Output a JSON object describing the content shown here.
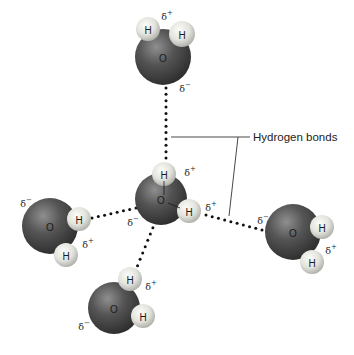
{
  "diagram": {
    "callout_label": "Hydrogen bonds",
    "colors": {
      "oxygen_dark": "#3f3f3f",
      "oxygen_light": "#8a8a8a",
      "hydrogen_light": "#f2f2ee",
      "hydrogen_dark": "#b8b8b2",
      "bond_dots": "#111111",
      "line": "#333333"
    },
    "atom_labels": {
      "oxygen": "O",
      "hydrogen": "H"
    },
    "charges": {
      "positive": "δ+",
      "negative": "δ−"
    },
    "molecules": [
      {
        "id": "top",
        "oxygen": {
          "label": "O",
          "x": 163,
          "y": 57,
          "r": 28
        },
        "hydrogens": [
          {
            "label": "H",
            "x": 148,
            "y": 29,
            "r": 12
          },
          {
            "label": "H",
            "x": 182,
            "y": 34,
            "r": 13
          }
        ],
        "charges": [
          {
            "label": "δ+",
            "x": 167,
            "y": 16
          },
          {
            "label": "δ−",
            "x": 185,
            "y": 88
          }
        ]
      },
      {
        "id": "center",
        "oxygen": {
          "label": "O",
          "x": 161,
          "y": 199,
          "r": 26
        },
        "hydrogens": [
          {
            "label": "H",
            "x": 164,
            "y": 174,
            "r": 12
          },
          {
            "label": "H",
            "x": 189,
            "y": 211,
            "r": 12
          }
        ],
        "charges": [
          {
            "label": "δ+",
            "x": 190,
            "y": 172
          },
          {
            "label": "δ+",
            "x": 211,
            "y": 207
          },
          {
            "label": "δ−",
            "x": 133,
            "y": 222
          }
        ]
      },
      {
        "id": "left",
        "oxygen": {
          "label": "O",
          "x": 50,
          "y": 226,
          "r": 28
        },
        "hydrogens": [
          {
            "label": "H",
            "x": 66,
            "y": 255,
            "r": 12
          },
          {
            "label": "H",
            "x": 79,
            "y": 219,
            "r": 12
          }
        ],
        "charges": [
          {
            "label": "δ−",
            "x": 26,
            "y": 203
          },
          {
            "label": "δ+",
            "x": 88,
            "y": 244
          }
        ]
      },
      {
        "id": "right",
        "oxygen": {
          "label": "O",
          "x": 293,
          "y": 232,
          "r": 28
        },
        "hydrogens": [
          {
            "label": "H",
            "x": 312,
            "y": 262,
            "r": 12
          },
          {
            "label": "H",
            "x": 322,
            "y": 227,
            "r": 12
          }
        ],
        "charges": [
          {
            "label": "δ−",
            "x": 263,
            "y": 220
          },
          {
            "label": "δ+",
            "x": 331,
            "y": 250
          }
        ]
      },
      {
        "id": "bottom",
        "oxygen": {
          "label": "O",
          "x": 114,
          "y": 308,
          "r": 26
        },
        "hydrogens": [
          {
            "label": "H",
            "x": 130,
            "y": 279,
            "r": 12
          },
          {
            "label": "H",
            "x": 143,
            "y": 316,
            "r": 12
          }
        ],
        "charges": [
          {
            "label": "δ+",
            "x": 151,
            "y": 286
          },
          {
            "label": "δ−",
            "x": 84,
            "y": 326
          }
        ]
      }
    ],
    "hydrogen_bonds": [
      {
        "id": "top-to-center",
        "x1": 166,
        "y1": 88,
        "x2": 166,
        "y2": 158
      },
      {
        "id": "left-to-center",
        "x1": 92,
        "y1": 218,
        "x2": 136,
        "y2": 208
      },
      {
        "id": "center-to-right",
        "x1": 206,
        "y1": 215,
        "x2": 262,
        "y2": 230
      },
      {
        "id": "center-to-bottom",
        "x1": 158,
        "y1": 215,
        "x2": 135,
        "y2": 272
      }
    ],
    "callout_lines": {
      "horizontal": {
        "x1": 171,
        "y1": 137,
        "x2": 238,
        "y2": 137
      },
      "to_label": {
        "x1": 238,
        "y1": 137,
        "x2": 250,
        "y2": 137
      },
      "diagonal": {
        "x1": 238,
        "y1": 137,
        "x2": 229,
        "y2": 216
      }
    },
    "center_internal_bonds": [
      {
        "x1": 164,
        "y1": 181,
        "x2": 164,
        "y2": 195
      },
      {
        "x1": 168,
        "y1": 203,
        "x2": 180,
        "y2": 208
      }
    ]
  }
}
